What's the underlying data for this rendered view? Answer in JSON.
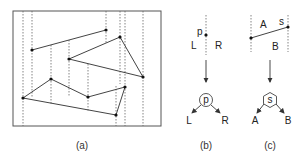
{
  "figure": {
    "panels": [
      {
        "id": "a",
        "caption": "(a)",
        "description": "Set of line segments in a bounding box with vertical dashed lines through each endpoint (trapezoidal decomposition)"
      },
      {
        "id": "b",
        "caption": "(b)",
        "point_label": "p",
        "left_label": "L",
        "right_label": "R",
        "node_label": "p",
        "child_left": "L",
        "child_right": "R",
        "node_shape": "circle"
      },
      {
        "id": "c",
        "caption": "(c)",
        "segment_label": "s",
        "above_label": "A",
        "below_label": "B",
        "node_label": "s",
        "child_left": "A",
        "child_right": "B",
        "node_shape": "hexagon"
      }
    ]
  },
  "colors": {
    "stroke": "#444444",
    "dash": "#666666",
    "point": "#111111",
    "background": "#ffffff"
  }
}
